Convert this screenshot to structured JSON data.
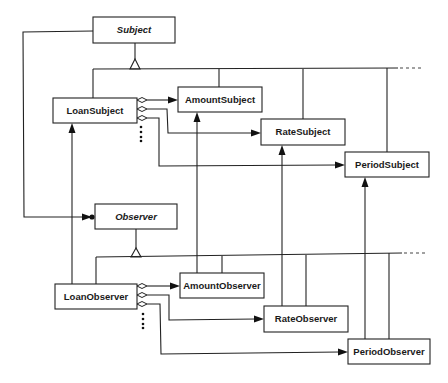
{
  "diagram": {
    "type": "UML class diagram (Observer pattern)",
    "classes": {
      "subject": {
        "name": "Subject",
        "abstract": true
      },
      "loan_subject": {
        "name": "LoanSubject",
        "abstract": false
      },
      "amount_subject": {
        "name": "AmountSubject",
        "abstract": false
      },
      "rate_subject": {
        "name": "RateSubject",
        "abstract": false
      },
      "period_subject": {
        "name": "PeriodSubject",
        "abstract": false
      },
      "observer": {
        "name": "Observer",
        "abstract": true
      },
      "loan_observer": {
        "name": "LoanObserver",
        "abstract": false
      },
      "amount_observer": {
        "name": "AmountObserver",
        "abstract": false
      },
      "rate_observer": {
        "name": "RateObserver",
        "abstract": false
      },
      "period_observer": {
        "name": "PeriodObserver",
        "abstract": false
      }
    },
    "relationships": [
      {
        "type": "generalization",
        "parent": "Subject",
        "children": [
          "LoanSubject",
          "AmountSubject",
          "RateSubject",
          "PeriodSubject",
          "..."
        ]
      },
      {
        "type": "generalization",
        "parent": "Observer",
        "children": [
          "LoanObserver",
          "AmountObserver",
          "RateObserver",
          "PeriodObserver",
          "..."
        ]
      },
      {
        "type": "aggregation",
        "from": "LoanSubject",
        "to": [
          "AmountSubject",
          "RateSubject",
          "PeriodSubject",
          "..."
        ]
      },
      {
        "type": "aggregation",
        "from": "LoanObserver",
        "to": [
          "AmountObserver",
          "RateObserver",
          "PeriodObserver",
          "..."
        ]
      },
      {
        "type": "association-many",
        "from": "Subject",
        "to": "Observer"
      },
      {
        "type": "association",
        "from": "LoanObserver",
        "to": "LoanSubject"
      },
      {
        "type": "association",
        "from": "AmountObserver",
        "to": "AmountSubject"
      },
      {
        "type": "association",
        "from": "RateObserver",
        "to": "RateSubject"
      },
      {
        "type": "association",
        "from": "PeriodObserver",
        "to": "PeriodSubject"
      }
    ],
    "colors": {
      "line": "#222222",
      "background": "#ffffff",
      "text": "#1a1a1a"
    }
  }
}
